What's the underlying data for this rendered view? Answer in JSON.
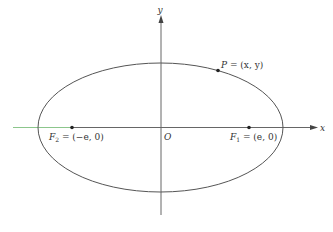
{
  "diagram": {
    "type": "ellipse-with-foci",
    "colors": {
      "background": "#ffffff",
      "curve": "#555555",
      "axis": "#666666",
      "axis_left_segment": "#7fbf7f",
      "point": "#222222",
      "text": "#333333"
    },
    "axes": {
      "x_label": "x",
      "y_label": "y",
      "origin_label": "O"
    },
    "ellipse": {
      "cx": 160.5,
      "cy": 127.5,
      "rx": 122.5,
      "ry": 64.5
    },
    "points": {
      "P": {
        "name": "P",
        "text": " = (x, y)"
      },
      "F1": {
        "name": "F",
        "sub": "1",
        "text": " = (e, 0)"
      },
      "F2": {
        "name": "F",
        "sub": "2",
        "text": " = (−e, 0)"
      }
    }
  }
}
